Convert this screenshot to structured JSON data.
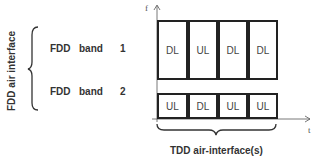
{
  "left": {
    "group_label": "FDD air interface",
    "rows": [
      {
        "fdd": "FDD",
        "band": "band",
        "num": "1"
      },
      {
        "fdd": "FDD",
        "band": "band",
        "num": "2"
      }
    ]
  },
  "axes": {
    "y_label": "f",
    "x_label": "t"
  },
  "band1_slots": [
    "DL",
    "UL",
    "DL",
    "DL"
  ],
  "band2_slots": [
    "UL",
    "DL",
    "UL",
    "UL"
  ],
  "bottom_label": "TDD air-interface(s)"
}
